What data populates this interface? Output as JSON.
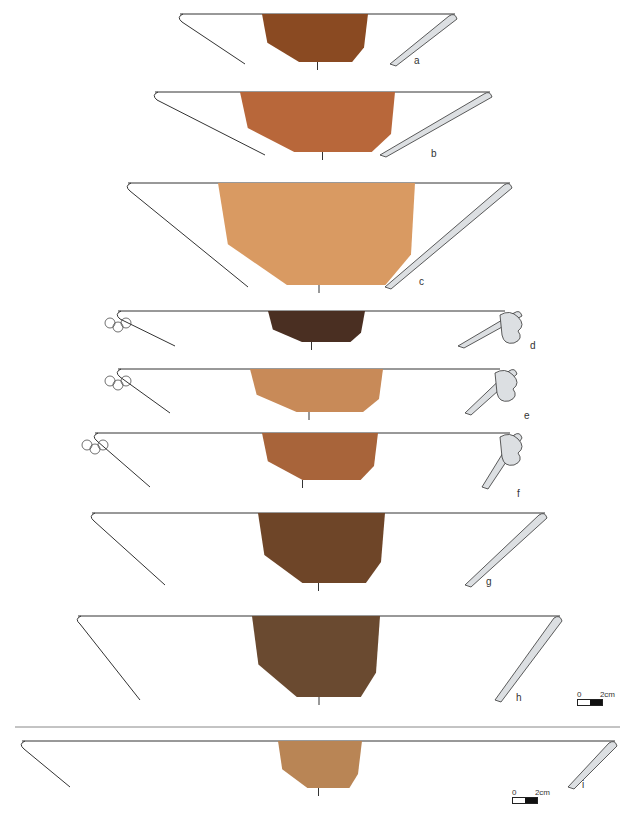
{
  "figure": {
    "type": "archaeological pottery plate",
    "sherds": [
      {
        "label": "a",
        "color": "#8a4a22",
        "rim_decoration": false
      },
      {
        "label": "b",
        "color": "#b8673a",
        "rim_decoration": false
      },
      {
        "label": "c",
        "color": "#d99a62",
        "rim_decoration": false
      },
      {
        "label": "d",
        "color": "#4a2f22",
        "rim_decoration": true
      },
      {
        "label": "e",
        "color": "#c88a58",
        "rim_decoration": true
      },
      {
        "label": "f",
        "color": "#a8643a",
        "rim_decoration": true
      },
      {
        "label": "g",
        "color": "#6e4528",
        "rim_decoration": false
      },
      {
        "label": "h",
        "color": "#6a4a30",
        "rim_decoration": false
      },
      {
        "label": "i",
        "color": "#b98555",
        "rim_decoration": false
      }
    ],
    "scale_bars": [
      {
        "zero": "0",
        "length": "2cm"
      },
      {
        "zero": "0",
        "length": "2cm"
      }
    ],
    "section_fill": "#dcdfe2",
    "line_color": "#333333"
  }
}
